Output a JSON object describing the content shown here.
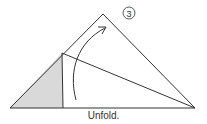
{
  "diagram": {
    "step_number": "3",
    "caption": "Unfold.",
    "colors": {
      "line": "#333333",
      "shade": "#d9d9d9"
    }
  }
}
